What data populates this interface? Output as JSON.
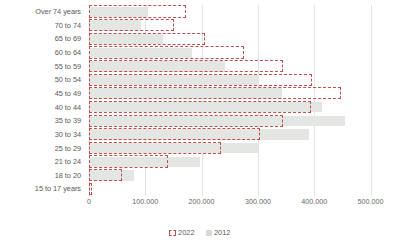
{
  "chart_data": {
    "type": "bar",
    "orientation": "horizontal",
    "title": "",
    "subtitle": "",
    "xlabel": "",
    "ylabel": "",
    "grid": true,
    "legend_position": "bottom",
    "xlim": [
      0,
      500000
    ],
    "xticks": [
      0,
      100000,
      200000,
      300000,
      400000,
      500000
    ],
    "xtick_labels": [
      "0",
      "100.000",
      "200.000",
      "300.000",
      "400.000",
      "500.000"
    ],
    "categories": [
      "Over 74 years",
      "70 to 74",
      "65 to 69",
      "60 to 64",
      "55 to 59",
      "50 to 54",
      "45 to 49",
      "40 to 44",
      "35 to 39",
      "30 to 34",
      "25 to 29",
      "21 to 24",
      "18 to 20",
      "15 to 17 years"
    ],
    "series": [
      {
        "name": "2022",
        "color": "#c0504d",
        "style": "dashed-outline",
        "values": [
          172000,
          151000,
          206000,
          275000,
          345000,
          396000,
          448000,
          395000,
          345000,
          304000,
          235000,
          141000,
          58000,
          6000
        ]
      },
      {
        "name": "2012",
        "color": "#e4e6e3",
        "style": "filled",
        "values": [
          105000,
          93000,
          132000,
          183000,
          241000,
          300000,
          343000,
          414000,
          455000,
          390000,
          300000,
          198000,
          80000,
          0
        ]
      }
    ]
  },
  "legend": {
    "items": [
      {
        "label": "2022",
        "icon": "dashed-square-swatch"
      },
      {
        "label": "2012",
        "icon": "gray-square-swatch"
      }
    ]
  }
}
